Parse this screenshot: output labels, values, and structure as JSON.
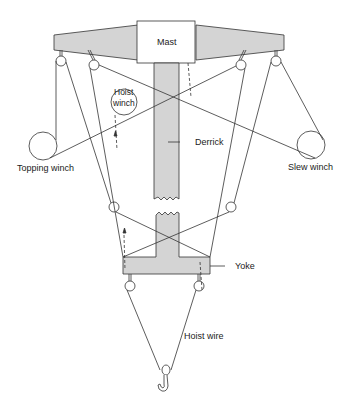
{
  "diagram": {
    "type": "derrick crane rigging schematic",
    "colors": {
      "fill": "#d4d4d4",
      "stroke": "#333333",
      "background": "#ffffff"
    },
    "labels": {
      "mast": "Mast",
      "hoist_winch_line1": "Hoist",
      "hoist_winch_line2": "winch",
      "derrick": "Derrick",
      "topping_winch": "Topping winch",
      "slew_winch": "Slew winch",
      "yoke": "Yoke",
      "hoist_wire": "Hoist wire"
    }
  }
}
